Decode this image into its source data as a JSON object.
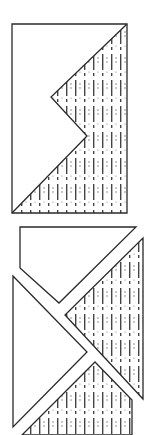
{
  "figure": {
    "stroke_color": "#2a2a2a",
    "hatch_color": "#444444",
    "background": "#ffffff",
    "top_figure": {
      "outline": [
        [
          12,
          24
        ],
        [
          127,
          24
        ],
        [
          127,
          213
        ],
        [
          12,
          213
        ]
      ],
      "hatched_region": [
        [
          127,
          24
        ],
        [
          127,
          213
        ],
        [
          12,
          213
        ],
        [
          87,
          136
        ],
        [
          51,
          97
        ]
      ]
    },
    "bottom_figure": {
      "pieces": [
        {
          "name": "top-piece",
          "hatched": false,
          "points": [
            [
              20,
              227
            ],
            [
              136,
              227
            ],
            [
              59,
              303
            ],
            [
              20,
              268
            ]
          ]
        },
        {
          "name": "left-piece",
          "hatched": false,
          "points": [
            [
              13,
              276
            ],
            [
              87,
              352
            ],
            [
              13,
              427
            ]
          ]
        },
        {
          "name": "right-piece",
          "hatched": true,
          "points": [
            [
              143,
              238
            ],
            [
              143,
              399
            ],
            [
              65,
              315
            ]
          ]
        },
        {
          "name": "bottom-piece",
          "hatched": true,
          "points": [
            [
              95,
              362
            ],
            [
              132,
              400
            ],
            [
              132,
              435
            ],
            [
              22,
              435
            ]
          ]
        }
      ]
    }
  }
}
